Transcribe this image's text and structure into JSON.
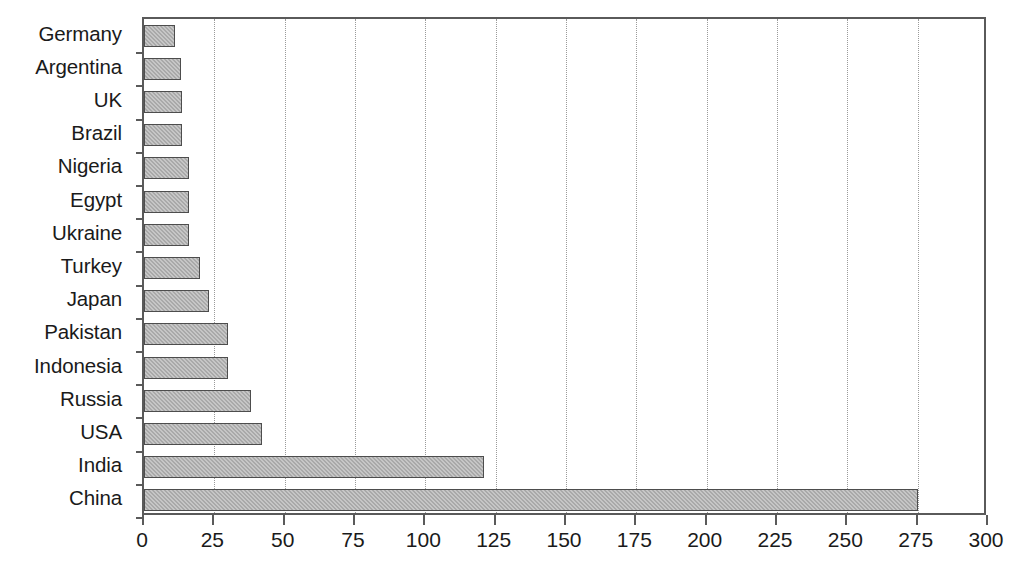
{
  "chart_data": {
    "type": "bar",
    "orientation": "horizontal",
    "title": "",
    "subtitle": "",
    "xlabel": "",
    "ylabel": "",
    "xlim": [
      0,
      300
    ],
    "ylim": null,
    "grid": "vertical-dotted",
    "legend": null,
    "xticks": [
      0,
      25,
      50,
      75,
      100,
      125,
      150,
      175,
      200,
      225,
      250,
      275,
      300
    ],
    "xtick_labels": [
      "0",
      "25",
      "50",
      "75",
      "100",
      "125",
      "150",
      "175",
      "200",
      "225",
      "250",
      "275",
      "300"
    ],
    "categories": [
      "Germany",
      "Argentina",
      "UK",
      "Brazil",
      "Nigeria",
      "Egypt",
      "Ukraine",
      "Turkey",
      "Japan",
      "Pakistan",
      "Indonesia",
      "Russia",
      "USA",
      "India",
      "China"
    ],
    "values": [
      11,
      13,
      13.5,
      13.5,
      16,
      16,
      16,
      20,
      23,
      30,
      30,
      38,
      42,
      121,
      275
    ],
    "series": [
      {
        "name": "value",
        "values": [
          11,
          13,
          13.5,
          13.5,
          16,
          16,
          16,
          20,
          23,
          30,
          30,
          38,
          42,
          121,
          275
        ]
      }
    ],
    "bar_fill_color": "#a9a9a9",
    "bar_edge_color": "#4d4d4d",
    "axis_color": "#5a5a5a",
    "gridline_color": "#9a9a9a",
    "background_color": "#ffffff"
  }
}
